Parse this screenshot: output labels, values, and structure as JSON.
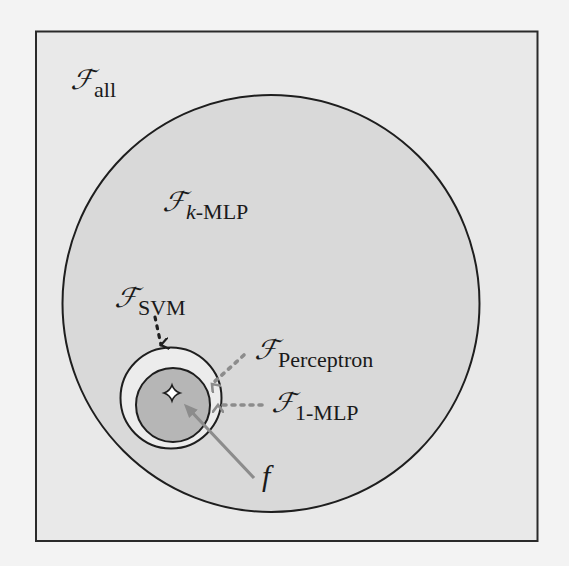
{
  "diagram": {
    "type": "nested-set-venn",
    "colors": {
      "page_background": "#f3f3f3",
      "frame_background": "#e9e9e9",
      "frame_border": "#2a2a2a",
      "kmlp_fill": "#d9d9d9",
      "svm_fill": "#ececec",
      "mlp1_fill": "#b6b6b6",
      "circle_stroke": "#1e1e1e",
      "gray_arrow": "#8c8c8c",
      "black_arrow": "#1e1e1e"
    },
    "sets": [
      {
        "id": "all",
        "symbol": "ℱ",
        "subscript": "all",
        "description": "outer frame"
      },
      {
        "id": "k-mlp",
        "symbol": "ℱ",
        "subscript_italic": "k",
        "subscript": "-MLP",
        "description": "large circle"
      },
      {
        "id": "svm",
        "symbol": "ℱ",
        "subscript": "SVM",
        "description": "medium ring"
      },
      {
        "id": "perceptron",
        "symbol": "ℱ",
        "subscript": "Perceptron",
        "description": "inner circle boundary"
      },
      {
        "id": "1-mlp",
        "symbol": "ℱ",
        "subscript": "1-MLP",
        "description": "inner shaded circle"
      }
    ],
    "labels": {
      "all": {
        "symbol": "ℱ",
        "sub": "all"
      },
      "kmlp": {
        "symbol": "ℱ",
        "sub_italic": "k",
        "sub": "-MLP"
      },
      "svm": {
        "symbol": "ℱ",
        "sub": "SVM"
      },
      "perceptron": {
        "symbol": "ℱ",
        "sub": "Perceptron"
      },
      "mlp1": {
        "symbol": "ℱ",
        "sub": "1-MLP"
      },
      "target": "f"
    },
    "annotations": [
      {
        "from": "svm-label",
        "to": "svm-circle",
        "style": "black dotted arrow"
      },
      {
        "from": "perceptron-label",
        "to": "inner circle",
        "style": "gray dotted arrow"
      },
      {
        "from": "1-mlp-label",
        "to": "inner circle",
        "style": "gray dotted arrow"
      },
      {
        "from": "f-label",
        "to": "star point",
        "style": "gray solid arrow"
      }
    ],
    "marker": {
      "shape": "four-point-star",
      "meaning": "target function f"
    }
  }
}
